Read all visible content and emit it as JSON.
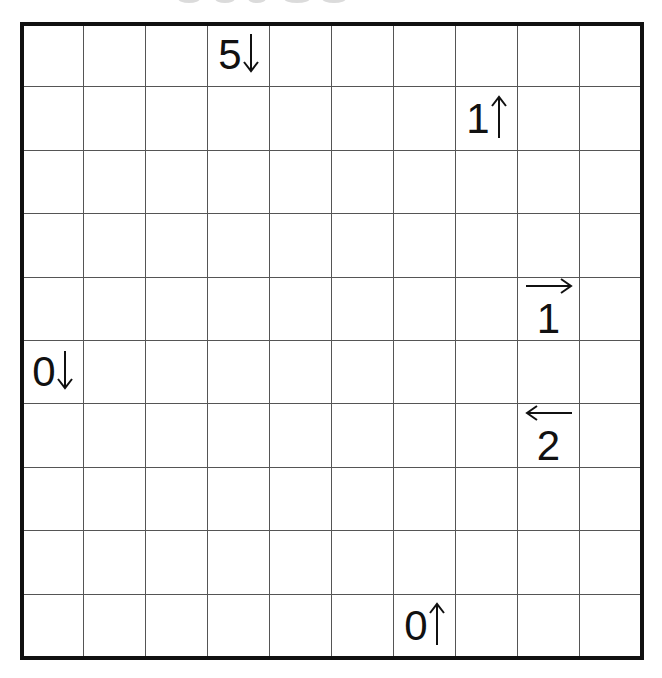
{
  "puzzle": {
    "type": "Yajilin",
    "rows": 10,
    "cols": 10,
    "colors": {
      "grid_line": "#555555",
      "frame": "#111111",
      "clue_text": "#111111",
      "background": "#ffffff"
    },
    "clues": [
      {
        "row": 0,
        "col": 3,
        "number": "5",
        "direction": "down",
        "layout": "horiz"
      },
      {
        "row": 1,
        "col": 7,
        "number": "1",
        "direction": "up",
        "layout": "horiz"
      },
      {
        "row": 4,
        "col": 8,
        "number": "1",
        "direction": "right",
        "layout": "vert"
      },
      {
        "row": 5,
        "col": 0,
        "number": "0",
        "direction": "down",
        "layout": "horiz"
      },
      {
        "row": 6,
        "col": 8,
        "number": "2",
        "direction": "left",
        "layout": "vert"
      },
      {
        "row": 9,
        "col": 6,
        "number": "0",
        "direction": "up",
        "layout": "horiz"
      }
    ]
  }
}
